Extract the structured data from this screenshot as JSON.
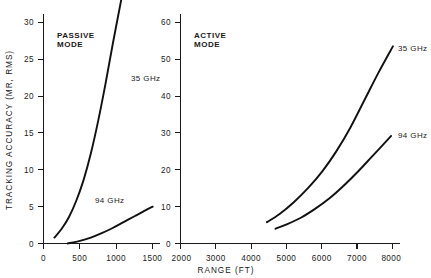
{
  "chart_data": [
    {
      "type": "line",
      "title": "PASSIVE MODE",
      "panel_label": "PASSIVE\nMODE",
      "panel_label_line1": "PASSIVE",
      "panel_label_line2": "MODE",
      "xlabel": "",
      "ylabel": "TRACKING ACCURACY (MR, RMS)",
      "xlim": [
        0,
        1600
      ],
      "ylim": [
        0,
        33
      ],
      "xticks": [
        0,
        500,
        1000,
        1500
      ],
      "xtick_labels": [
        "0",
        "500",
        "1000",
        "1500"
      ],
      "yticks": [
        0,
        5,
        10,
        15,
        20,
        25,
        30
      ],
      "ytick_labels": [
        "0",
        "5",
        "10",
        "15",
        "20",
        "25",
        "30"
      ],
      "grid": false,
      "legend_position": "inline-annotation",
      "series": [
        {
          "name": "35 GHz",
          "label_x": 1000,
          "label_y": 22.5,
          "points": [
            {
              "x": 150,
              "y": 0.8
            },
            {
              "x": 250,
              "y": 2.0
            },
            {
              "x": 350,
              "y": 3.6
            },
            {
              "x": 450,
              "y": 5.8
            },
            {
              "x": 550,
              "y": 8.6
            },
            {
              "x": 650,
              "y": 12.2
            },
            {
              "x": 750,
              "y": 16.6
            },
            {
              "x": 850,
              "y": 21.6
            },
            {
              "x": 950,
              "y": 27.0
            },
            {
              "x": 1070,
              "y": 33.2
            }
          ]
        },
        {
          "name": "94 GHz",
          "label_x": 950,
          "label_y": 6.0,
          "points": [
            {
              "x": 330,
              "y": 0.0
            },
            {
              "x": 500,
              "y": 0.35
            },
            {
              "x": 650,
              "y": 0.8
            },
            {
              "x": 800,
              "y": 1.4
            },
            {
              "x": 950,
              "y": 2.1
            },
            {
              "x": 1100,
              "y": 2.9
            },
            {
              "x": 1250,
              "y": 3.7
            },
            {
              "x": 1400,
              "y": 4.5
            },
            {
              "x": 1500,
              "y": 5.0
            }
          ]
        }
      ]
    },
    {
      "type": "line",
      "title": "ACTIVE MODE",
      "panel_label_line1": "ACTIVE",
      "panel_label_line2": "MODE",
      "xlabel": "RANGE (FT)",
      "ylabel": "",
      "xlim": [
        2000,
        8200
      ],
      "ylim": [
        0,
        65
      ],
      "xticks": [
        2000,
        3000,
        4000,
        5000,
        6000,
        7000,
        8000
      ],
      "xtick_labels": [
        "2000",
        "3000",
        "4000",
        "5000",
        "6000",
        "7000",
        "8000"
      ],
      "yticks": [
        0,
        10,
        20,
        30,
        40,
        50,
        60
      ],
      "ytick_labels": [
        "0",
        "10",
        "20",
        "30",
        "40",
        "50",
        "60"
      ],
      "grid": false,
      "legend_position": "inline-annotation",
      "series": [
        {
          "name": "35 GHz",
          "label_x": 8150,
          "label_y": 54.5,
          "points": [
            {
              "x": 4440,
              "y": 5.8
            },
            {
              "x": 4800,
              "y": 8.0
            },
            {
              "x": 5200,
              "y": 11.2
            },
            {
              "x": 5600,
              "y": 15.0
            },
            {
              "x": 6000,
              "y": 19.5
            },
            {
              "x": 6400,
              "y": 25.0
            },
            {
              "x": 6800,
              "y": 31.5
            },
            {
              "x": 7200,
              "y": 39.0
            },
            {
              "x": 7600,
              "y": 46.5
            },
            {
              "x": 8000,
              "y": 53.5
            }
          ]
        },
        {
          "name": "94 GHz",
          "label_x": 8150,
          "label_y": 30.0,
          "points": [
            {
              "x": 4680,
              "y": 4.0
            },
            {
              "x": 5000,
              "y": 5.2
            },
            {
              "x": 5400,
              "y": 7.0
            },
            {
              "x": 5800,
              "y": 9.4
            },
            {
              "x": 6200,
              "y": 12.2
            },
            {
              "x": 6600,
              "y": 15.6
            },
            {
              "x": 7000,
              "y": 19.4
            },
            {
              "x": 7400,
              "y": 23.5
            },
            {
              "x": 7950,
              "y": 29.2
            }
          ]
        }
      ]
    }
  ],
  "figure": {
    "y_axis_title": "TRACKING ACCURACY (MR, RMS)",
    "x_axis_title": "RANGE (FT)",
    "left_panel": {
      "mode_line1": "PASSIVE",
      "mode_line2": "MODE",
      "label_35": "35 GHz",
      "label_94": "94 GHz",
      "ytick_0": "0",
      "ytick_5": "5",
      "ytick_10": "10",
      "ytick_15": "15",
      "ytick_20": "20",
      "ytick_25": "25",
      "ytick_30": "30",
      "xtick_0": "0",
      "xtick_500": "500",
      "xtick_1000": "1000",
      "xtick_1500": "1500"
    },
    "right_panel": {
      "mode_line1": "ACTIVE",
      "mode_line2": "MODE",
      "label_35": "35 GHz",
      "label_94": "94 GHz",
      "ytick_0": "0",
      "ytick_10": "10",
      "ytick_20": "20",
      "ytick_30": "30",
      "ytick_40": "40",
      "ytick_50": "50",
      "ytick_60": "60",
      "xtick_2000": "2000",
      "xtick_3000": "3000",
      "xtick_4000": "4000",
      "xtick_5000": "5000",
      "xtick_6000": "6000",
      "xtick_7000": "7000",
      "xtick_8000": "8000"
    },
    "colors": {
      "curve": "#111111",
      "axis": "#1a1a1a",
      "background": "#ffffff"
    }
  }
}
